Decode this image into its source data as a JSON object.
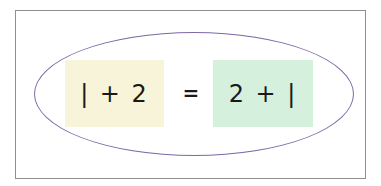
{
  "diagram": {
    "left_expression": "| + 2",
    "equals": "=",
    "right_expression": "2 + |",
    "colors": {
      "left_box": "#f7f4d9",
      "right_box": "#d5f0dd",
      "ellipse_stroke": "#7e68a6",
      "frame_border": "#8f8f8f",
      "text": "#1a1a1a"
    }
  }
}
